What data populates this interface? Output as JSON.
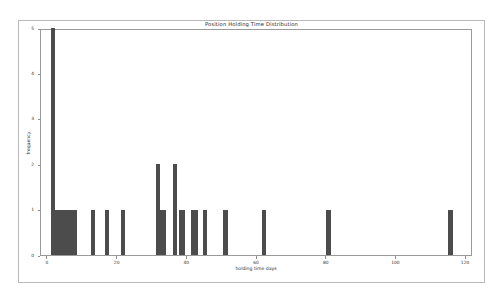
{
  "chart_data": {
    "type": "bar",
    "title": "Position Holding Time Distribution",
    "xlabel": "holding time days",
    "ylabel": "frequency",
    "xlim": [
      -2,
      122
    ],
    "ylim": [
      0,
      5
    ],
    "xticks": [
      0,
      20,
      40,
      60,
      80,
      100,
      120
    ],
    "xticklabels": [
      "0",
      "20",
      "40",
      "60",
      "80",
      "100",
      "120"
    ],
    "yticks": [
      0,
      1,
      2,
      3,
      4,
      5
    ],
    "yticklabels": [
      "0",
      "1",
      "2",
      "3",
      "4",
      "5"
    ],
    "grid": false,
    "legend": false,
    "bar_color": "#4c4c4c",
    "x": [
      1.5,
      3.5,
      5.0,
      6.5,
      13.0,
      17.0,
      21.5,
      31.5,
      33.0,
      36.5,
      38.5,
      42.0,
      45.0,
      51.0,
      62.0,
      80.5,
      115.5
    ],
    "values": [
      5,
      1,
      1,
      1,
      1,
      1,
      1,
      2,
      1,
      2,
      1,
      1,
      1,
      1,
      1,
      1,
      1
    ],
    "bar_width_days": [
      1.2,
      3.6,
      3.6,
      3.6,
      1.2,
      1.3,
      1.3,
      1.2,
      1.9,
      1.2,
      1.9,
      1.9,
      1.2,
      1.3,
      1.3,
      1.3,
      1.3
    ]
  }
}
